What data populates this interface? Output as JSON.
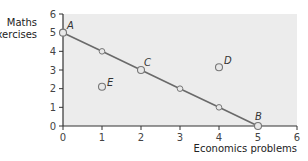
{
  "chart_data": {
    "type": "line",
    "title": "",
    "xlabel": "Economics problems",
    "ylabel": "Maths exercises",
    "ylabel_lines": [
      "Maths",
      "exercises"
    ],
    "xlim": [
      0,
      6
    ],
    "ylim": [
      0,
      6
    ],
    "x_ticks": [
      0,
      1,
      2,
      3,
      4,
      5,
      6
    ],
    "y_ticks": [
      0,
      1,
      2,
      3,
      4,
      5,
      6
    ],
    "grid": false,
    "legend": null,
    "series": [
      {
        "name": "Production possibility frontier",
        "points": [
          {
            "x": 0,
            "y": 5
          },
          {
            "x": 1,
            "y": 4
          },
          {
            "x": 2,
            "y": 3
          },
          {
            "x": 3,
            "y": 2
          },
          {
            "x": 4,
            "y": 1
          },
          {
            "x": 5,
            "y": 0
          }
        ]
      }
    ],
    "labeled_points": [
      {
        "label": "A",
        "x": 0,
        "y": 5
      },
      {
        "label": "B",
        "x": 5,
        "y": 0
      },
      {
        "label": "C",
        "x": 2,
        "y": 3
      },
      {
        "label": "D",
        "x": 4,
        "y": 3.15
      },
      {
        "label": "E",
        "x": 1,
        "y": 2.1
      }
    ],
    "colors": {
      "plot_background": "#ececec",
      "line": "#6a6a6a",
      "marker_fill": "#e8e8e8",
      "marker_stroke": "#777777",
      "axis": "#333333"
    }
  }
}
